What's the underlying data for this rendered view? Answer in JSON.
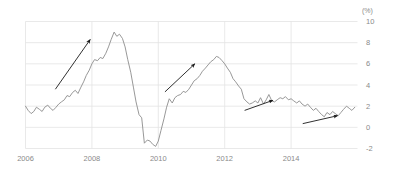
{
  "chart_data": {
    "type": "line",
    "title": "",
    "subtitle": "",
    "xlabel": "",
    "ylabel": "",
    "unit_label": "(%)",
    "grid": true,
    "legend": "none",
    "xlim": [
      2006.0,
      2016.0
    ],
    "ylim": [
      -2,
      10
    ],
    "x_ticks": [
      2006,
      2008,
      2010,
      2012,
      2014
    ],
    "x_tick_labels": [
      "2006",
      "2008",
      "2010",
      "2012",
      "2014"
    ],
    "y_ticks": [
      -2,
      0,
      2,
      4,
      6,
      8,
      10
    ],
    "y_tick_labels": [
      "-2",
      "0",
      "2",
      "4",
      "6",
      "8",
      "10"
    ],
    "series": [
      {
        "name": "rate",
        "color": "#8c8c8c",
        "x": [
          2006.0,
          2006.08,
          2006.17,
          2006.25,
          2006.33,
          2006.42,
          2006.5,
          2006.58,
          2006.67,
          2006.75,
          2006.83,
          2006.92,
          2007.0,
          2007.08,
          2007.17,
          2007.25,
          2007.33,
          2007.42,
          2007.5,
          2007.58,
          2007.67,
          2007.75,
          2007.83,
          2007.92,
          2008.0,
          2008.08,
          2008.17,
          2008.25,
          2008.33,
          2008.42,
          2008.5,
          2008.58,
          2008.67,
          2008.75,
          2008.83,
          2008.92,
          2009.0,
          2009.08,
          2009.17,
          2009.25,
          2009.33,
          2009.42,
          2009.5,
          2009.58,
          2009.67,
          2009.75,
          2009.83,
          2009.92,
          2010.0,
          2010.08,
          2010.17,
          2010.25,
          2010.33,
          2010.42,
          2010.5,
          2010.58,
          2010.67,
          2010.75,
          2010.83,
          2010.92,
          2011.0,
          2011.08,
          2011.17,
          2011.25,
          2011.33,
          2011.42,
          2011.5,
          2011.58,
          2011.67,
          2011.75,
          2011.83,
          2011.92,
          2012.0,
          2012.08,
          2012.17,
          2012.25,
          2012.33,
          2012.42,
          2012.5,
          2012.58,
          2012.67,
          2012.75,
          2012.83,
          2012.92,
          2013.0,
          2013.08,
          2013.17,
          2013.25,
          2013.33,
          2013.42,
          2013.5,
          2013.58,
          2013.67,
          2013.75,
          2013.83,
          2013.92,
          2014.0,
          2014.08,
          2014.17,
          2014.25,
          2014.33,
          2014.42,
          2014.5,
          2014.58,
          2014.67,
          2014.75,
          2014.83,
          2014.92,
          2015.0,
          2015.08,
          2015.17,
          2015.25,
          2015.33,
          2015.42,
          2015.5,
          2015.58,
          2015.67,
          2015.75,
          2015.83,
          2015.92
        ],
        "values": [
          2.0,
          1.6,
          1.3,
          1.5,
          1.9,
          1.7,
          1.5,
          1.9,
          2.1,
          1.8,
          1.6,
          1.9,
          2.2,
          2.4,
          2.6,
          3.0,
          2.9,
          3.3,
          3.5,
          3.2,
          3.8,
          4.3,
          4.9,
          5.4,
          6.0,
          6.4,
          6.3,
          6.6,
          6.5,
          7.0,
          7.6,
          8.3,
          9.0,
          8.6,
          8.8,
          8.4,
          7.6,
          6.4,
          5.2,
          3.8,
          2.4,
          1.2,
          0.9,
          -1.5,
          -1.2,
          -1.3,
          -1.6,
          -1.8,
          -1.3,
          -0.3,
          0.8,
          1.9,
          2.7,
          2.3,
          2.8,
          3.0,
          3.1,
          3.4,
          3.3,
          3.6,
          4.0,
          4.4,
          4.6,
          4.9,
          5.3,
          5.6,
          5.9,
          6.2,
          6.4,
          6.7,
          6.6,
          6.3,
          6.0,
          5.6,
          5.2,
          4.6,
          4.3,
          3.9,
          3.6,
          2.7,
          2.4,
          2.2,
          2.3,
          2.5,
          2.3,
          2.8,
          2.2,
          2.6,
          3.1,
          2.5,
          2.4,
          2.6,
          2.8,
          2.7,
          2.9,
          2.6,
          2.7,
          2.5,
          2.3,
          2.5,
          2.2,
          2.0,
          2.2,
          1.9,
          1.6,
          1.8,
          1.5,
          1.2,
          1.0,
          1.4,
          1.2,
          1.5,
          1.3,
          1.1,
          1.4,
          1.7,
          2.0,
          1.8,
          1.6,
          1.9
        ]
      }
    ],
    "annotations": [
      {
        "name": "trend-arrow-1",
        "type": "arrow",
        "from": {
          "x": 2006.9,
          "y": 3.6
        },
        "to": {
          "x": 2007.95,
          "y": 8.3
        },
        "color": "#1a1a1a"
      },
      {
        "name": "trend-arrow-2",
        "type": "arrow",
        "from": {
          "x": 2010.2,
          "y": 3.35
        },
        "to": {
          "x": 2011.1,
          "y": 6.0
        },
        "color": "#1a1a1a"
      },
      {
        "name": "trend-arrow-3",
        "type": "arrow",
        "from": {
          "x": 2012.6,
          "y": 1.6
        },
        "to": {
          "x": 2013.45,
          "y": 2.55
        },
        "color": "#1a1a1a"
      },
      {
        "name": "trend-arrow-4",
        "type": "arrow",
        "from": {
          "x": 2014.35,
          "y": 0.35
        },
        "to": {
          "x": 2015.4,
          "y": 1.1
        },
        "color": "#1a1a1a"
      }
    ],
    "style": {
      "grid_color": "#e3e3e3",
      "axis_text_color": "#8a8a8a",
      "line_color": "#8c8c8c",
      "background": "#ffffff"
    }
  }
}
